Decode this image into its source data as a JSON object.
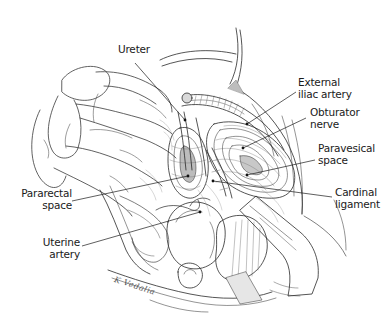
{
  "figure": {
    "type": "anatomical-illustration",
    "background_color": "#ffffff",
    "ink_color": "#1a1a1a"
  },
  "labels": [
    {
      "id": "ureter",
      "text": "Ureter",
      "side": "left",
      "x": 118,
      "y": 44,
      "line": {
        "x1": 135,
        "y1": 63,
        "x2": 185,
        "y2": 120
      }
    },
    {
      "id": "external-iliac-artery",
      "text": "External\niliac artery",
      "side": "left",
      "x": 298,
      "y": 77,
      "line": {
        "x1": 296,
        "y1": 92,
        "x2": 247,
        "y2": 124
      }
    },
    {
      "id": "obturator-nerve",
      "text": "Obturator\nnerve",
      "side": "left",
      "x": 310,
      "y": 107,
      "line": {
        "x1": 306,
        "y1": 118,
        "x2": 243,
        "y2": 148
      }
    },
    {
      "id": "paravesical-space",
      "text": "Paravesical\nspace",
      "side": "left",
      "x": 318,
      "y": 143,
      "line": {
        "x1": 315,
        "y1": 160,
        "x2": 247,
        "y2": 175
      }
    },
    {
      "id": "cardinal-ligament",
      "text": "Cardinal\nligament",
      "side": "left",
      "x": 335,
      "y": 187,
      "line": {
        "x1": 332,
        "y1": 197,
        "x2": 213,
        "y2": 181
      }
    },
    {
      "id": "pararectal-space",
      "text": "Pararectal\nspace",
      "side": "right",
      "x": 20,
      "y": 188,
      "line": {
        "x1": 72,
        "y1": 201,
        "x2": 188,
        "y2": 176
      }
    },
    {
      "id": "uterine-artery",
      "text": "Uterine\nartery",
      "side": "right",
      "x": 45,
      "y": 237,
      "line": {
        "x1": 82,
        "y1": 246,
        "x2": 200,
        "y2": 212
      }
    }
  ],
  "signature": {
    "text": "K Vedalia",
    "x": 116,
    "y": 275
  }
}
